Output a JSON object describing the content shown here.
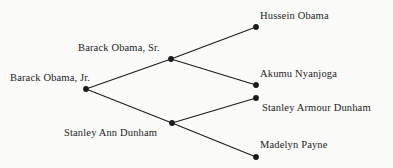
{
  "diagram": {
    "type": "family-tree",
    "background_color": "#fbfbfa",
    "line_color": "#1b1b1b",
    "node_color": "#1b1b1b",
    "text_color": "#1b1b1b",
    "nodes": [
      {
        "id": "barack-obama-jr",
        "label": "Barack Obama, Jr.",
        "x": 86,
        "y": 89,
        "label_x": 10,
        "label_y": 72,
        "label_side": "left"
      },
      {
        "id": "barack-obama-sr",
        "label": "Barack Obama, Sr.",
        "x": 171,
        "y": 59,
        "label_x": 78,
        "label_y": 42,
        "label_side": "left"
      },
      {
        "id": "stanley-ann-dunham",
        "label": "Stanley Ann Dunham",
        "x": 172,
        "y": 123,
        "label_x": 64,
        "label_y": 127,
        "label_side": "left"
      },
      {
        "id": "hussein-obama",
        "label": "Hussein Obama",
        "x": 256,
        "y": 27,
        "label_x": 260,
        "label_y": 10,
        "label_side": "right"
      },
      {
        "id": "akumu-nyanjoga",
        "label": "Akumu Nyanjoga",
        "x": 256,
        "y": 85,
        "label_x": 260,
        "label_y": 68,
        "label_side": "right"
      },
      {
        "id": "stanley-armour-dunham",
        "label": "Stanley Armour Dunham",
        "x": 256,
        "y": 98,
        "label_x": 262,
        "label_y": 102,
        "label_side": "right"
      },
      {
        "id": "madelyn-payne",
        "label": "Madelyn Payne",
        "x": 256,
        "y": 157,
        "label_x": 260,
        "label_y": 139,
        "label_side": "right"
      }
    ],
    "edges": [
      {
        "id": "edge-jr-to-sr",
        "from": "barack-obama-jr",
        "to": "barack-obama-sr"
      },
      {
        "id": "edge-jr-to-ann",
        "from": "barack-obama-jr",
        "to": "stanley-ann-dunham"
      },
      {
        "id": "edge-sr-to-hussein",
        "from": "barack-obama-sr",
        "to": "hussein-obama"
      },
      {
        "id": "edge-sr-to-akumu",
        "from": "barack-obama-sr",
        "to": "akumu-nyanjoga"
      },
      {
        "id": "edge-ann-to-stanley",
        "from": "stanley-ann-dunham",
        "to": "stanley-armour-dunham"
      },
      {
        "id": "edge-ann-to-madelyn",
        "from": "stanley-ann-dunham",
        "to": "madelyn-payne"
      }
    ]
  }
}
